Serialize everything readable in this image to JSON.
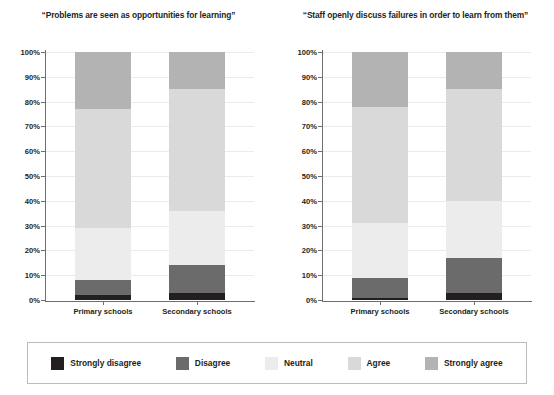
{
  "chart_data": [
    {
      "type": "bar",
      "subtype": "stacked-percentage",
      "title": "“Problems are seen as opportunities for learning”",
      "xlabel": "",
      "ylabel": "",
      "ylim": [
        0,
        100
      ],
      "grid": true,
      "legend_position": "bottom",
      "categories": [
        "Primary schools",
        "Secondary schools"
      ],
      "tick_labels": [
        "0%",
        "10%",
        "20%",
        "30%",
        "40%",
        "50%",
        "60%",
        "70%",
        "80%",
        "90%",
        "100%"
      ],
      "series": [
        {
          "name": "Strongly disagree",
          "color": "#231f20",
          "values": [
            2,
            3
          ]
        },
        {
          "name": "Disagree",
          "color": "#6b6b6b",
          "values": [
            6,
            11
          ]
        },
        {
          "name": "Neutral",
          "color": "#ececec",
          "values": [
            21,
            22
          ]
        },
        {
          "name": "Agree",
          "color": "#d9d9d9",
          "values": [
            48,
            49
          ]
        },
        {
          "name": "Strongly agree",
          "color": "#b3b3b3",
          "values": [
            23,
            15
          ]
        }
      ]
    },
    {
      "type": "bar",
      "subtype": "stacked-percentage",
      "title": "“Staff openly discuss failures in order to learn from them”",
      "xlabel": "",
      "ylabel": "",
      "ylim": [
        0,
        100
      ],
      "grid": true,
      "legend_position": "bottom",
      "categories": [
        "Primary schools",
        "Secondary schools"
      ],
      "tick_labels": [
        "0%",
        "10%",
        "20%",
        "30%",
        "40%",
        "50%",
        "60%",
        "70%",
        "80%",
        "90%",
        "100%"
      ],
      "series": [
        {
          "name": "Strongly disagree",
          "color": "#231f20",
          "values": [
            1,
            3
          ]
        },
        {
          "name": "Disagree",
          "color": "#6b6b6b",
          "values": [
            8,
            14
          ]
        },
        {
          "name": "Neutral",
          "color": "#ececec",
          "values": [
            22,
            23
          ]
        },
        {
          "name": "Agree",
          "color": "#d9d9d9",
          "values": [
            47,
            45
          ]
        },
        {
          "name": "Strongly agree",
          "color": "#b3b3b3",
          "values": [
            22,
            15
          ]
        }
      ]
    }
  ],
  "charts": [
    {
      "title": "“Problems are seen as opportunities for learning”",
      "ticks": [
        "100%",
        "90%",
        "80%",
        "70%",
        "60%",
        "50%",
        "40%",
        "30%",
        "20%",
        "10%",
        "0%"
      ],
      "categories": [
        "Primary schools",
        "Secondary schools"
      ]
    },
    {
      "title": "“Staff openly discuss failures in order to learn from them”",
      "ticks": [
        "100%",
        "90%",
        "80%",
        "70%",
        "60%",
        "50%",
        "40%",
        "30%",
        "20%",
        "10%",
        "0%"
      ],
      "categories": [
        "Primary schools",
        "Secondary schools"
      ]
    }
  ],
  "legend": {
    "items": [
      {
        "label": "Strongly disagree",
        "color": "#231f20"
      },
      {
        "label": "Disagree",
        "color": "#6b6b6b"
      },
      {
        "label": "Neutral",
        "color": "#ececec"
      },
      {
        "label": "Agree",
        "color": "#d9d9d9"
      },
      {
        "label": "Strongly agree",
        "color": "#b3b3b3"
      }
    ]
  }
}
